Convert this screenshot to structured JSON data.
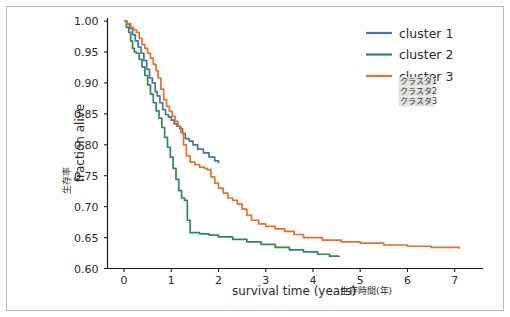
{
  "figure": {
    "background_color": "#ffffff",
    "border_color": "#b9b9b9"
  },
  "axes": {
    "x_title_en": "survival time (years)",
    "x_title_jp": "生存時間(年)",
    "y_title_en": "fraction alive",
    "y_title_jp": "生存率",
    "x_ticks": [
      "0",
      "1",
      "2",
      "3",
      "4",
      "5",
      "6",
      "7"
    ],
    "y_ticks": [
      "0.60",
      "0.65",
      "0.70",
      "0.75",
      "0.80",
      "0.85",
      "0.90",
      "0.95",
      "1.00"
    ]
  },
  "legend": {
    "entries": [
      {
        "label": "cluster 1",
        "color": "#4c72a0"
      },
      {
        "label": "cluster 2",
        "color": "#2f8a52"
      },
      {
        "label": "cluster 3",
        "color": "#e5712b"
      }
    ],
    "notes": [
      {
        "label": "クラスタ1"
      },
      {
        "label": "クラスタ2"
      },
      {
        "label": "クラスタ3"
      }
    ]
  },
  "chart_data": {
    "type": "line",
    "title": "",
    "xlabel": "survival time (years) 生存時間(年)",
    "ylabel": "fraction alive 生存率",
    "xlim": [
      -0.35,
      7.6
    ],
    "ylim": [
      0.6,
      1.005
    ],
    "grid": false,
    "legend_position": "upper right",
    "series": [
      {
        "name": "cluster 1",
        "color": "#4c72a0",
        "x": [
          0.0,
          0.06,
          0.12,
          0.18,
          0.24,
          0.3,
          0.36,
          0.42,
          0.48,
          0.54,
          0.6,
          0.66,
          0.7,
          0.76,
          0.82,
          0.88,
          0.94,
          1.0,
          1.06,
          1.12,
          1.18,
          1.24,
          1.3,
          1.38,
          1.46,
          1.56,
          1.68,
          1.8,
          1.92,
          2.0
        ],
        "y": [
          1.0,
          0.995,
          0.988,
          0.978,
          0.968,
          0.958,
          0.948,
          0.936,
          0.922,
          0.908,
          0.9,
          0.886,
          0.879,
          0.868,
          0.857,
          0.849,
          0.845,
          0.84,
          0.834,
          0.83,
          0.826,
          0.818,
          0.81,
          0.806,
          0.8,
          0.793,
          0.787,
          0.78,
          0.774,
          0.77
        ]
      },
      {
        "name": "cluster 2",
        "color": "#2f8a52",
        "x": [
          0.0,
          0.05,
          0.1,
          0.14,
          0.18,
          0.22,
          0.26,
          0.32,
          0.38,
          0.44,
          0.5,
          0.56,
          0.62,
          0.68,
          0.74,
          0.8,
          0.86,
          0.92,
          0.98,
          1.04,
          1.1,
          1.16,
          1.22,
          1.28,
          1.34,
          1.4,
          1.6,
          1.8,
          2.0,
          2.3,
          2.6,
          2.9,
          3.2,
          3.5,
          3.8,
          4.1,
          4.35,
          4.55
        ],
        "y": [
          1.0,
          0.99,
          0.982,
          0.968,
          0.956,
          0.95,
          0.948,
          0.938,
          0.926,
          0.912,
          0.897,
          0.882,
          0.868,
          0.855,
          0.843,
          0.828,
          0.812,
          0.796,
          0.78,
          0.762,
          0.744,
          0.726,
          0.714,
          0.71,
          0.678,
          0.658,
          0.656,
          0.654,
          0.651,
          0.647,
          0.643,
          0.639,
          0.634,
          0.63,
          0.627,
          0.623,
          0.62,
          0.618
        ]
      },
      {
        "name": "cluster 3",
        "color": "#e5712b",
        "x": [
          0.0,
          0.06,
          0.14,
          0.2,
          0.26,
          0.32,
          0.38,
          0.44,
          0.5,
          0.56,
          0.62,
          0.68,
          0.72,
          0.78,
          0.84,
          0.9,
          0.96,
          1.02,
          1.08,
          1.14,
          1.2,
          1.26,
          1.32,
          1.4,
          1.5,
          1.6,
          1.7,
          1.76,
          1.84,
          1.92,
          2.0,
          2.1,
          2.2,
          2.3,
          2.4,
          2.5,
          2.6,
          2.7,
          2.85,
          3.0,
          3.2,
          3.4,
          3.6,
          3.8,
          4.2,
          4.6,
          5.0,
          5.5,
          6.0,
          6.5,
          7.1
        ],
        "y": [
          1.0,
          0.996,
          0.99,
          0.986,
          0.982,
          0.972,
          0.962,
          0.956,
          0.948,
          0.94,
          0.93,
          0.92,
          0.908,
          0.89,
          0.873,
          0.862,
          0.854,
          0.846,
          0.838,
          0.83,
          0.82,
          0.8,
          0.782,
          0.772,
          0.768,
          0.764,
          0.762,
          0.76,
          0.748,
          0.738,
          0.73,
          0.722,
          0.714,
          0.71,
          0.704,
          0.696,
          0.686,
          0.678,
          0.672,
          0.668,
          0.664,
          0.66,
          0.655,
          0.65,
          0.646,
          0.643,
          0.641,
          0.638,
          0.636,
          0.634,
          0.632
        ]
      }
    ]
  }
}
